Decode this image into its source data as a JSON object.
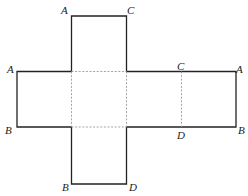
{
  "diagram": {
    "type": "cube-net",
    "colors": {
      "edge": "#222222",
      "fold": "#9a9a9a",
      "background": "#ffffff"
    },
    "labels": {
      "top_left": "A",
      "top_right": "C",
      "left_top": "A",
      "left_bottom": "B",
      "right_fold_top": "C",
      "right_top": "A",
      "right_fold_bottom": "D",
      "right_bottom": "B",
      "bottom_left": "B",
      "bottom_right": "D"
    }
  }
}
